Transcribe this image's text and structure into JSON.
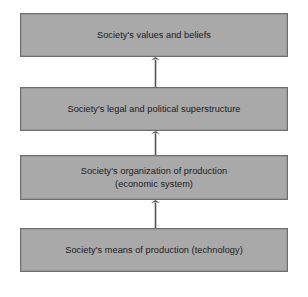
{
  "diagram": {
    "type": "vertical-flow-stack",
    "direction": "upward",
    "canvas": {
      "width": 308,
      "height": 297,
      "background": "#ffffff"
    },
    "style": {
      "box_fill": "#a9a9a9",
      "box_border": "#6e6e6e",
      "text_color": "#1a1a1a",
      "arrow_color": "#555555"
    },
    "tiers": [
      {
        "id": "values-beliefs",
        "lines": [
          "Society's values and beliefs"
        ],
        "rect": {
          "x": 20,
          "y": 13,
          "width": 268,
          "height": 44
        }
      },
      {
        "id": "legal-political-superstructure",
        "lines": [
          "Society's legal and political superstructure"
        ],
        "rect": {
          "x": 20,
          "y": 87,
          "width": 268,
          "height": 44
        }
      },
      {
        "id": "organization-of-production",
        "lines": [
          "Society's organization of production",
          "(economic system)"
        ],
        "rect": {
          "x": 20,
          "y": 155,
          "width": 268,
          "height": 45
        }
      },
      {
        "id": "means-of-production",
        "lines": [
          "Society's means of production (technology)"
        ],
        "rect": {
          "x": 20,
          "y": 228,
          "width": 268,
          "height": 44
        }
      }
    ],
    "arrows": [
      {
        "id": "arrow-production-to-organization",
        "from": "means-of-production",
        "to": "organization-of-production",
        "x": 149,
        "y": 200,
        "height": 28
      },
      {
        "id": "arrow-organization-to-superstructure",
        "from": "organization-of-production",
        "to": "legal-political-superstructure",
        "x": 149,
        "y": 131,
        "height": 24
      },
      {
        "id": "arrow-superstructure-to-values",
        "from": "legal-political-superstructure",
        "to": "values-beliefs",
        "x": 149,
        "y": 57,
        "height": 30
      }
    ]
  }
}
